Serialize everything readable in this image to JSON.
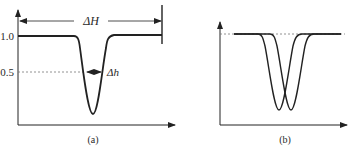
{
  "panel_a": {
    "caption": "(a)",
    "y_tick_high": "1.0",
    "y_tick_mid": "0.5",
    "wide_width_label": "ΔH",
    "narrow_width_label": "Δh"
  },
  "panel_b": {
    "caption": "(b)"
  },
  "colors": {
    "line": "#222222",
    "dashed": "#777777",
    "background": "#ffffff"
  }
}
